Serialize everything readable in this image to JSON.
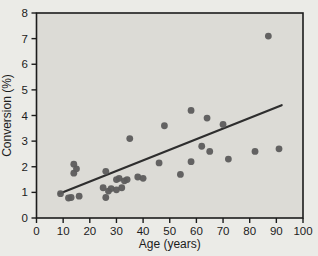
{
  "chart_data": {
    "type": "scatter",
    "title": "",
    "xlabel": "Age (years)",
    "ylabel": "Conversion (%)",
    "xlim": [
      0,
      100
    ],
    "ylim": [
      0,
      8
    ],
    "x_ticks": [
      0,
      10,
      20,
      30,
      40,
      50,
      60,
      70,
      80,
      90,
      100
    ],
    "y_ticks": [
      0,
      1,
      2,
      3,
      4,
      5,
      6,
      7,
      8
    ],
    "grid": false,
    "legend": null,
    "points": [
      [
        9,
        0.95
      ],
      [
        12,
        0.78
      ],
      [
        13,
        0.8
      ],
      [
        14,
        2.1
      ],
      [
        14,
        1.75
      ],
      [
        15,
        1.92
      ],
      [
        16,
        0.85
      ],
      [
        25,
        1.18
      ],
      [
        26,
        1.82
      ],
      [
        26,
        0.8
      ],
      [
        27,
        1.05
      ],
      [
        28,
        1.15
      ],
      [
        30,
        1.5
      ],
      [
        30,
        1.1
      ],
      [
        31,
        1.55
      ],
      [
        32,
        1.18
      ],
      [
        33,
        1.45
      ],
      [
        34,
        1.5
      ],
      [
        35,
        3.1
      ],
      [
        38,
        1.6
      ],
      [
        40,
        1.55
      ],
      [
        46,
        2.15
      ],
      [
        48,
        3.6
      ],
      [
        54,
        1.7
      ],
      [
        58,
        2.2
      ],
      [
        58,
        4.2
      ],
      [
        62,
        2.8
      ],
      [
        64,
        3.9
      ],
      [
        65,
        2.6
      ],
      [
        70,
        3.65
      ],
      [
        72,
        2.3
      ],
      [
        82,
        2.6
      ],
      [
        87,
        7.1
      ],
      [
        91,
        2.7
      ]
    ],
    "trend_line": {
      "x_start": 8.5,
      "y_start": 0.95,
      "x_end": 92,
      "y_end": 4.4
    },
    "colors": {
      "page_bg": "#ebebe7",
      "plot_bg": "#dcdbd6",
      "axis": "#1c1c1c",
      "text": "#1c1c1c",
      "dot": "#5c5c5c",
      "line": "#2e2e2e"
    }
  }
}
